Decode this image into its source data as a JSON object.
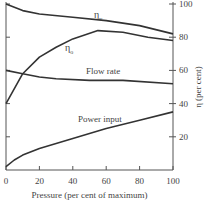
{
  "chart_data": {
    "type": "line",
    "title": "",
    "xlabel": "Pressure (per cent of maximum)",
    "ylabel": "η (per cent)",
    "xlim": [
      0,
      100
    ],
    "ylim": [
      0,
      100
    ],
    "x_ticks": [
      0,
      20,
      40,
      60,
      80,
      100
    ],
    "y_ticks": [
      20,
      40,
      60,
      80,
      100
    ],
    "y_axis_side": "right",
    "grid": false,
    "legend": "inline labels",
    "series": [
      {
        "name": "ηv",
        "label_main": "η",
        "label_sub": "v",
        "x": [
          0,
          10,
          20,
          40,
          60,
          80,
          100
        ],
        "y": [
          100,
          96,
          94,
          92,
          90,
          87,
          82
        ]
      },
      {
        "name": "ηo",
        "label_main": "η",
        "label_sub": "o",
        "x": [
          0,
          10,
          20,
          30,
          40,
          55,
          70,
          85,
          100
        ],
        "y": [
          40,
          58,
          68,
          74,
          79,
          84,
          83,
          80,
          78
        ]
      },
      {
        "name": "Flow rate",
        "x": [
          0,
          10,
          20,
          30,
          50,
          70,
          100
        ],
        "y": [
          60,
          58,
          56,
          55,
          54,
          54,
          52
        ]
      },
      {
        "name": "Power input",
        "x": [
          0,
          5,
          10,
          20,
          40,
          60,
          80,
          100
        ],
        "y": [
          2,
          6,
          9,
          13,
          19,
          25,
          30,
          35
        ]
      }
    ]
  }
}
